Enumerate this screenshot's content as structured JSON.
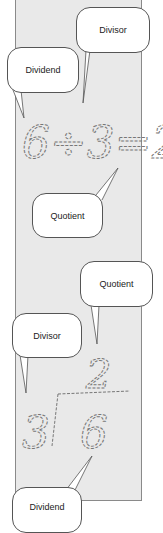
{
  "diagram": {
    "colors": {
      "panel": "#e9e9e9",
      "panel_border": "#8a8a8a",
      "bubble_fill": "#ffffff",
      "bubble_border": "#555555",
      "sketch": "#777777"
    },
    "top_example": {
      "expression": "6÷3=2",
      "dividend": "6",
      "operator": "÷",
      "divisor": "3",
      "equals": "=",
      "quotient": "2",
      "callouts": [
        {
          "label": "Divisor",
          "points_to": "3"
        },
        {
          "label": "Dividend",
          "points_to": "6"
        },
        {
          "label": "Quotient",
          "points_to": "2"
        }
      ]
    },
    "bottom_example": {
      "divisor": "3",
      "dividend": "6",
      "quotient": "2",
      "callouts": [
        {
          "label": "Quotient",
          "points_to": "2"
        },
        {
          "label": "Divisor",
          "points_to": "3"
        },
        {
          "label": "Dividend",
          "points_to": "6"
        }
      ]
    }
  }
}
